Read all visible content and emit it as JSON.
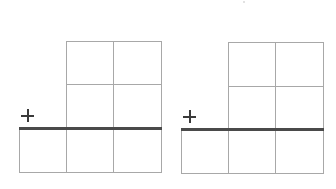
{
  "diagram": {
    "type": "vertical-addition-worksheet",
    "line_color": "#a8a8a8",
    "sum_line_color": "#4a4a4a",
    "problems": [
      {
        "id": 1,
        "operator": "+",
        "operator_icon": "plus-icon",
        "addend_rows": 2,
        "addend_columns": 2,
        "answer_columns": 3,
        "cells": {
          "addend_1": [
            "",
            ""
          ],
          "addend_2": [
            "",
            ""
          ],
          "answer": [
            "",
            "",
            ""
          ]
        }
      },
      {
        "id": 2,
        "operator": "+",
        "operator_icon": "plus-icon",
        "addend_rows": 2,
        "addend_columns": 2,
        "answer_columns": 3,
        "cells": {
          "addend_1": [
            "",
            ""
          ],
          "addend_2": [
            "",
            ""
          ],
          "answer": [
            "",
            "",
            ""
          ]
        }
      }
    ]
  }
}
